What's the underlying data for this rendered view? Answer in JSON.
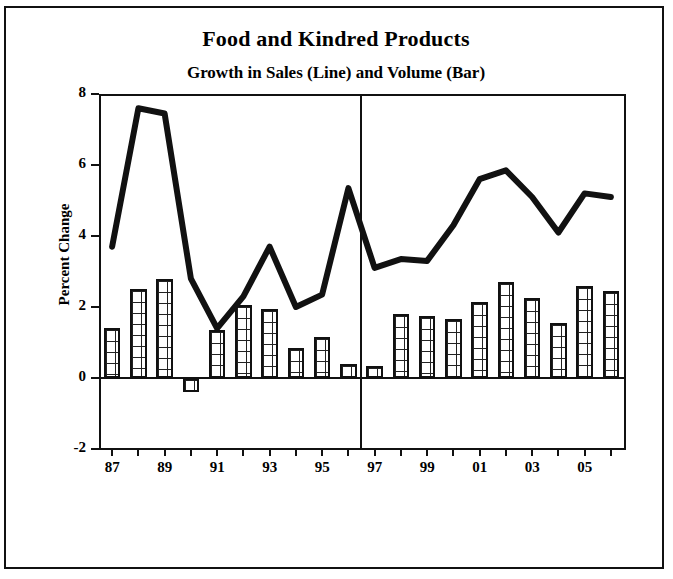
{
  "title": "Food and Kindred Products",
  "subtitle": "Growth in Sales (Line) and Volume (Bar)",
  "yaxis_title": "Percent Change",
  "ytick_labels": [
    "8",
    "6",
    "4",
    "2",
    "0",
    "-2"
  ],
  "xtick_labels": [
    "87",
    "89",
    "91",
    "93",
    "95",
    "97",
    "99",
    "01",
    "03",
    "05"
  ],
  "chart_data": {
    "type": "bar",
    "title": "Food and Kindred Products",
    "subtitle": "Growth in Sales (Line) and Volume (Bar)",
    "xlabel": "",
    "ylabel": "Percent Change",
    "ylim": [
      -2,
      8
    ],
    "yticks": [
      -2,
      0,
      2,
      4,
      6,
      8
    ],
    "grid": false,
    "legend_position": "none",
    "categories": [
      "87",
      "88",
      "89",
      "90",
      "91",
      "92",
      "93",
      "94",
      "95",
      "96",
      "97",
      "98",
      "99",
      "00",
      "01",
      "02",
      "03",
      "04",
      "05",
      "06"
    ],
    "xtick_shown": [
      "87",
      "89",
      "91",
      "93",
      "95",
      "97",
      "99",
      "01",
      "03",
      "05"
    ],
    "annotations": [
      "vertical divider line between 96 and 97"
    ],
    "series": [
      {
        "name": "Volume (Bar)",
        "type": "bar",
        "values": [
          1.4,
          2.5,
          2.8,
          -0.4,
          1.35,
          2.05,
          1.95,
          0.85,
          1.15,
          0.4,
          0.35,
          1.8,
          1.75,
          1.65,
          2.15,
          2.7,
          2.25,
          1.55,
          2.6,
          2.45
        ]
      },
      {
        "name": "Sales (Line)",
        "type": "line",
        "values": [
          3.7,
          7.6,
          7.45,
          2.8,
          1.4,
          2.3,
          3.7,
          2.0,
          2.35,
          5.35,
          3.1,
          3.35,
          3.3,
          4.3,
          5.6,
          5.85,
          5.1,
          4.1,
          5.2,
          5.1
        ]
      }
    ]
  }
}
